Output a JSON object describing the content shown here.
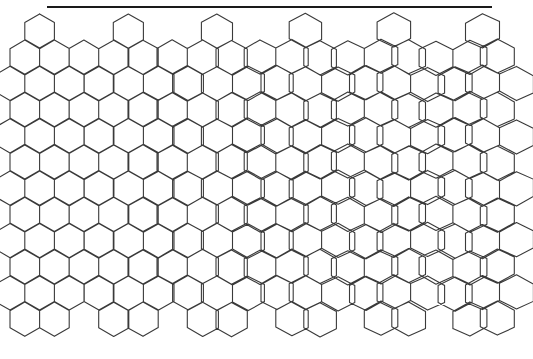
{
  "figure": {
    "rule_line": {
      "x1": 47,
      "x2": 492,
      "y": 7,
      "color": "#1a1a1a"
    },
    "stroke_color": "#3a3a3a",
    "background": "#ffffff",
    "lattice": {
      "hex_width": 29.6,
      "row_step": 26.2,
      "origin_x": 10,
      "origin_y": 31,
      "columns": 18,
      "rows": 12,
      "morph_start_x": 40,
      "morph_end_x": 470,
      "morph_strength": 0.42
    },
    "regions": [
      {
        "name": "left",
        "tile": "regular hexagon"
      },
      {
        "name": "right",
        "tile": "hexagon subdivided into 3 pentagons by Y-junction"
      }
    ]
  }
}
